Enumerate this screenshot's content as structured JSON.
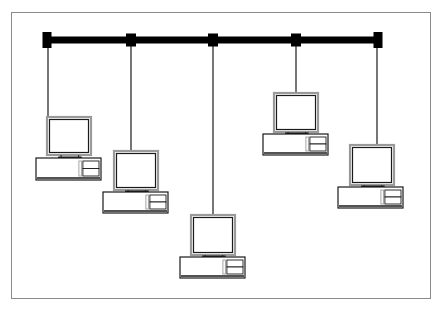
{
  "diagram": {
    "type": "bus-network-topology",
    "colors": {
      "background": "#ffffff",
      "frame": "#8a8a8a",
      "bus": "#000000",
      "drop_line": "#1a1a1a",
      "computer_stroke": "#1a1a1a",
      "computer_shadow": "#9a9a9a"
    },
    "bus": {
      "y": 40,
      "x_start": 47,
      "x_end": 380,
      "thickness": 7,
      "terminators": [
        {
          "id": "left-terminator",
          "x": 47
        },
        {
          "id": "right-terminator",
          "x": 378
        }
      ],
      "taps": [
        131,
        213,
        296
      ]
    },
    "computers": [
      {
        "id": "computer-1",
        "drop_x": 48,
        "monitor": {
          "x": 47,
          "y": 117,
          "w": 44,
          "h": 38
        },
        "base": {
          "x": 36,
          "y": 158,
          "w": 65,
          "h": 22
        }
      },
      {
        "id": "computer-2",
        "drop_x": 131,
        "monitor": {
          "x": 114,
          "y": 151,
          "w": 44,
          "h": 39
        },
        "base": {
          "x": 103,
          "y": 192,
          "w": 65,
          "h": 21
        }
      },
      {
        "id": "computer-3",
        "drop_x": 213,
        "monitor": {
          "x": 191,
          "y": 215,
          "w": 44,
          "h": 40
        },
        "base": {
          "x": 180,
          "y": 257,
          "w": 65,
          "h": 21
        }
      },
      {
        "id": "computer-4",
        "drop_x": 296,
        "monitor": {
          "x": 274,
          "y": 93,
          "w": 44,
          "h": 39
        },
        "base": {
          "x": 263,
          "y": 134,
          "w": 65,
          "h": 21
        }
      },
      {
        "id": "computer-5",
        "drop_x": 377,
        "monitor": {
          "x": 350,
          "y": 145,
          "w": 44,
          "h": 40
        },
        "base": {
          "x": 338,
          "y": 187,
          "w": 65,
          "h": 21
        }
      }
    ]
  }
}
